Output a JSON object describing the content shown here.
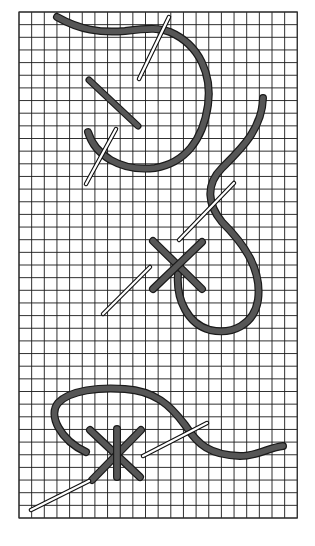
{
  "figure": {
    "description": "Needlepoint stitch diagram on canvas grid showing three stitch sequences",
    "canvas": {
      "x": 19,
      "y": 12,
      "cols": 22,
      "rows": 40,
      "cell": 12.65
    },
    "colors": {
      "thread": "#565656",
      "thread_outline": "#1a1a1a",
      "needle": "#ffffff",
      "grid": "#1a1a1a",
      "background": "#ffffff"
    },
    "stitches": [
      {
        "name": "diagonal-stitch",
        "label": "Tent / diagonal stitch"
      },
      {
        "name": "cross-stitch",
        "label": "Cross stitch"
      },
      {
        "name": "star-stitch",
        "label": "Double cross stitch"
      }
    ]
  }
}
